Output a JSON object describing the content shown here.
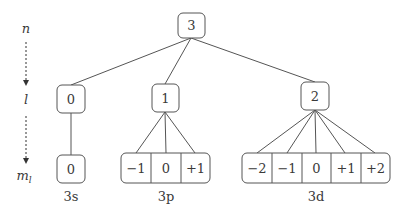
{
  "axis": {
    "levels": [
      {
        "label": "n"
      },
      {
        "label": "l"
      },
      {
        "label": "m",
        "subscript": "l"
      }
    ]
  },
  "tree": {
    "root": {
      "value": "3"
    },
    "subshells": [
      {
        "l": "0",
        "ml": [
          "0"
        ],
        "name": "3s"
      },
      {
        "l": "1",
        "ml": [
          "−1",
          "0",
          "+1"
        ],
        "name": "3p"
      },
      {
        "l": "2",
        "ml": [
          "−2",
          "−1",
          "0",
          "+1",
          "+2"
        ],
        "name": "3d"
      }
    ]
  }
}
